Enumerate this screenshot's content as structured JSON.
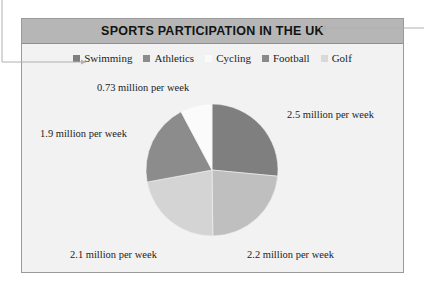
{
  "chart": {
    "title": "SPORTS PARTICIPATION IN THE UK",
    "title_bar_color": "#b6b6b6",
    "panel_background": "#f2f2f2",
    "panel_border_color": "#9a9a9a"
  },
  "legend": {
    "position": "top",
    "items": [
      {
        "label": "Swimming",
        "color": "#7f7f7f"
      },
      {
        "label": "Athletics",
        "color": "#8c8c8c"
      },
      {
        "label": "Cycling",
        "color": "#fafafa"
      },
      {
        "label": "Football",
        "color": "#8a8a8a"
      },
      {
        "label": "Golf",
        "color": "#d9d9d9"
      }
    ]
  },
  "labels": {
    "cycling": "0.73 million per week",
    "athletics": "1.9 million per week",
    "swimming": "2.5 million per week",
    "golf": "2.1 million per week",
    "football": "2.2 million per week"
  },
  "chart_data": {
    "type": "pie",
    "title": "SPORTS PARTICIPATION IN THE UK",
    "unit": "million per week",
    "total": 9.43,
    "start_angle_deg": 0,
    "direction": "clockwise",
    "categories": [
      "Swimming",
      "Football",
      "Golf",
      "Athletics",
      "Cycling"
    ],
    "values": [
      2.5,
      2.2,
      2.1,
      1.9,
      0.73
    ],
    "data_labels": [
      "2.5 million per week",
      "2.2 million per week",
      "2.1 million per week",
      "1.9 million per week",
      "0.73 million per week"
    ],
    "slices": [
      {
        "name": "Swimming",
        "value": 2.5,
        "label": "2.5 million per week",
        "color": "#7f7f7f",
        "start_deg": 0,
        "sweep_deg": 95.4
      },
      {
        "name": "Football",
        "value": 2.2,
        "label": "2.2 million per week",
        "color": "#bfbfbf",
        "start_deg": 95.4,
        "sweep_deg": 83.9
      },
      {
        "name": "Golf",
        "value": 2.1,
        "label": "2.1 million per week",
        "color": "#d4d4d4",
        "start_deg": 179.3,
        "sweep_deg": 80.2
      },
      {
        "name": "Athletics",
        "value": 1.9,
        "label": "1.9 million per week",
        "color": "#8c8c8c",
        "start_deg": 259.5,
        "sweep_deg": 72.5
      },
      {
        "name": "Cycling",
        "value": 0.73,
        "label": "0.73 million per week",
        "color": "#fbfbfb",
        "start_deg": 332.0,
        "sweep_deg": 28.0
      }
    ],
    "geometry": {
      "center_x": 212,
      "center_y": 170,
      "radius": 66
    },
    "legend": [
      "Swimming",
      "Athletics",
      "Cycling",
      "Football",
      "Golf"
    ],
    "xlabel": "",
    "ylabel": "",
    "grid": false
  },
  "annotations": {
    "title_callout": "leader line pointing to chart title",
    "legend_callout": "leader line pointing to chart legend"
  }
}
